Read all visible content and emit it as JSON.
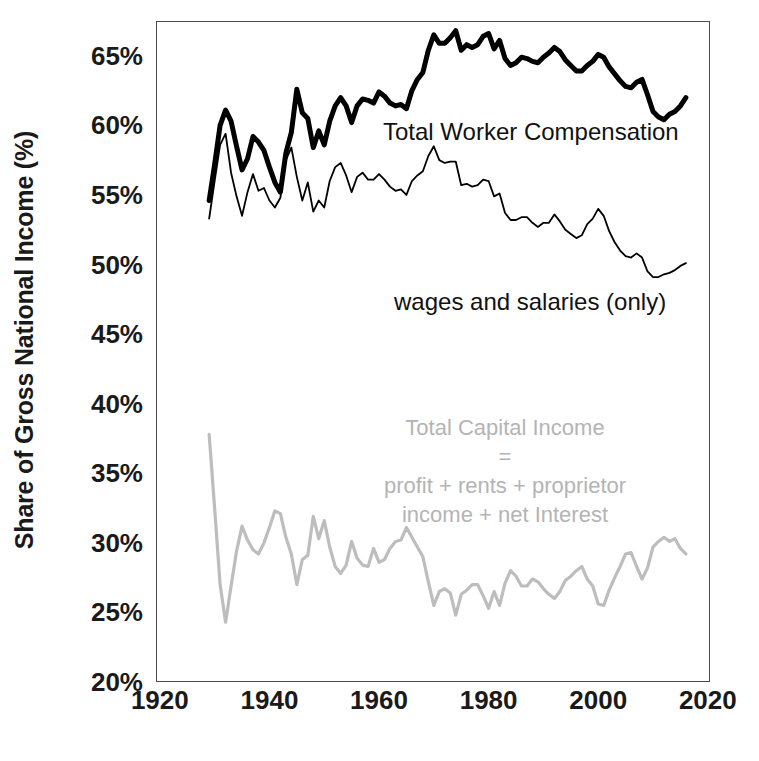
{
  "figure": {
    "background": "#ffffff",
    "plot_border_color": "#4a4a4a"
  },
  "axes": {
    "ylabel": "Share of Gross National Income (%)",
    "yticks": [
      "20%",
      "25%",
      "30%",
      "35%",
      "40%",
      "45%",
      "50%",
      "55%",
      "60%",
      "65%"
    ],
    "ytick_values": [
      20,
      25,
      30,
      35,
      40,
      45,
      50,
      55,
      60,
      65
    ],
    "xticks": [
      "1920",
      "1940",
      "1960",
      "1980",
      "2000",
      "2020"
    ],
    "xtick_values": [
      1920,
      1940,
      1960,
      1980,
      2000,
      2020
    ],
    "xlabel": ""
  },
  "annotations": {
    "total_worker_compensation": "Total Worker Compensation",
    "wages_and_salaries": "wages and salaries (only)",
    "total_capital_income_lines": [
      "Total Capital Income",
      "=",
      "profit + rents + proprietor",
      "income + net Interest"
    ]
  },
  "chart_data": {
    "type": "line",
    "title": "",
    "xlabel": "",
    "ylabel": "Share of Gross National Income (%)",
    "xlim": [
      1919.3,
      2020.4
    ],
    "ylim": [
      20,
      67.5
    ],
    "grid": false,
    "legend": "inline-annotations",
    "series": [
      {
        "name": "Total Worker Compensation",
        "color": "#000000",
        "linewidth": 5,
        "x": [
          1929,
          1930,
          1931,
          1932,
          1933,
          1934,
          1935,
          1936,
          1937,
          1938,
          1939,
          1940,
          1941,
          1942,
          1943,
          1944,
          1945,
          1946,
          1947,
          1948,
          1949,
          1950,
          1951,
          1952,
          1953,
          1954,
          1955,
          1956,
          1957,
          1958,
          1959,
          1960,
          1961,
          1962,
          1963,
          1964,
          1965,
          1966,
          1967,
          1968,
          1969,
          1970,
          1971,
          1972,
          1973,
          1974,
          1975,
          1976,
          1977,
          1978,
          1979,
          1980,
          1981,
          1982,
          1983,
          1984,
          1985,
          1986,
          1987,
          1988,
          1989,
          1990,
          1991,
          1992,
          1993,
          1994,
          1995,
          1996,
          1997,
          1998,
          1999,
          2000,
          2001,
          2002,
          2003,
          2004,
          2005,
          2006,
          2007,
          2008,
          2009,
          2010,
          2011,
          2012,
          2013,
          2014,
          2015,
          2016
        ],
        "values": [
          54.6,
          57.2,
          60.0,
          61.1,
          60.3,
          58.5,
          56.8,
          57.6,
          59.2,
          58.8,
          58.2,
          57.0,
          55.9,
          55.2,
          58.0,
          59.5,
          62.6,
          60.9,
          60.5,
          58.4,
          59.6,
          58.6,
          60.3,
          61.4,
          62.0,
          61.4,
          60.2,
          61.4,
          61.9,
          61.8,
          61.6,
          62.4,
          62.1,
          61.6,
          61.4,
          61.5,
          61.2,
          62.5,
          63.3,
          63.8,
          65.4,
          66.5,
          65.9,
          65.9,
          66.3,
          66.8,
          65.4,
          65.8,
          65.6,
          65.8,
          66.4,
          66.6,
          65.5,
          66.1,
          64.8,
          64.3,
          64.5,
          64.9,
          64.8,
          64.6,
          64.5,
          64.9,
          65.2,
          65.6,
          65.3,
          64.7,
          64.3,
          63.9,
          63.9,
          64.3,
          64.6,
          65.1,
          64.9,
          64.2,
          63.7,
          63.2,
          62.8,
          62.7,
          63.1,
          63.3,
          62.2,
          61.0,
          60.6,
          60.4,
          60.8,
          61.0,
          61.4,
          62.0
        ]
      },
      {
        "name": "wages and salaries (only)",
        "color": "#000000",
        "linewidth": 1.8,
        "x": [
          1929,
          1930,
          1931,
          1932,
          1933,
          1934,
          1935,
          1936,
          1937,
          1938,
          1939,
          1940,
          1941,
          1942,
          1943,
          1944,
          1945,
          1946,
          1947,
          1948,
          1949,
          1950,
          1951,
          1952,
          1953,
          1954,
          1955,
          1956,
          1957,
          1958,
          1959,
          1960,
          1961,
          1962,
          1963,
          1964,
          1965,
          1966,
          1967,
          1968,
          1969,
          1970,
          1971,
          1972,
          1973,
          1974,
          1975,
          1976,
          1977,
          1978,
          1979,
          1980,
          1981,
          1982,
          1983,
          1984,
          1985,
          1986,
          1987,
          1988,
          1989,
          1990,
          1991,
          1992,
          1993,
          1994,
          1995,
          1996,
          1997,
          1998,
          1999,
          2000,
          2001,
          2002,
          2003,
          2004,
          2005,
          2006,
          2007,
          2008,
          2009,
          2010,
          2011,
          2012,
          2013,
          2014,
          2015,
          2016
        ],
        "values": [
          53.3,
          56.0,
          58.6,
          59.4,
          56.6,
          54.9,
          53.5,
          55.2,
          56.5,
          55.3,
          55.5,
          54.6,
          54.1,
          54.8,
          57.5,
          58.4,
          56.3,
          54.6,
          55.9,
          53.8,
          54.6,
          54.1,
          56.0,
          57.0,
          57.3,
          56.4,
          55.2,
          56.3,
          56.6,
          56.1,
          56.1,
          56.5,
          56.1,
          55.6,
          55.3,
          55.4,
          55.0,
          56.0,
          56.4,
          56.7,
          57.8,
          58.5,
          57.5,
          57.3,
          57.4,
          57.4,
          55.7,
          55.8,
          55.6,
          55.7,
          56.1,
          56.0,
          54.9,
          55.1,
          53.7,
          53.2,
          53.2,
          53.4,
          53.4,
          53.0,
          52.7,
          53.0,
          53.0,
          53.6,
          53.1,
          52.5,
          52.2,
          51.9,
          52.1,
          52.9,
          53.3,
          54.0,
          53.5,
          52.4,
          51.6,
          51.0,
          50.6,
          50.5,
          50.8,
          50.5,
          49.5,
          49.1,
          49.1,
          49.3,
          49.4,
          49.6,
          49.9,
          50.1
        ]
      },
      {
        "name": "Total Capital Income",
        "color": "#bdbdbd",
        "linewidth": 3.2,
        "x": [
          1929,
          1930,
          1931,
          1932,
          1933,
          1934,
          1935,
          1936,
          1937,
          1938,
          1939,
          1940,
          1941,
          1942,
          1943,
          1944,
          1945,
          1946,
          1947,
          1948,
          1949,
          1950,
          1951,
          1952,
          1953,
          1954,
          1955,
          1956,
          1957,
          1958,
          1959,
          1960,
          1961,
          1962,
          1963,
          1964,
          1965,
          1966,
          1967,
          1968,
          1969,
          1970,
          1971,
          1972,
          1973,
          1974,
          1975,
          1976,
          1977,
          1978,
          1979,
          1980,
          1981,
          1982,
          1983,
          1984,
          1985,
          1986,
          1987,
          1988,
          1989,
          1990,
          1991,
          1992,
          1993,
          1994,
          1995,
          1996,
          1997,
          1998,
          1999,
          2000,
          2001,
          2002,
          2003,
          2004,
          2005,
          2006,
          2007,
          2008,
          2009,
          2010,
          2011,
          2012,
          2013,
          2014,
          2015,
          2016
        ],
        "values": [
          37.8,
          32.5,
          27.0,
          24.3,
          26.9,
          29.4,
          31.2,
          30.2,
          29.5,
          29.2,
          30.0,
          31.1,
          32.3,
          32.1,
          30.4,
          29.2,
          27.0,
          28.8,
          29.1,
          31.9,
          30.3,
          31.6,
          29.7,
          28.3,
          27.8,
          28.4,
          30.1,
          28.9,
          28.4,
          28.3,
          29.6,
          28.6,
          28.8,
          29.6,
          30.1,
          30.2,
          31.1,
          30.4,
          29.7,
          29.0,
          27.2,
          25.5,
          26.5,
          26.7,
          26.4,
          24.8,
          26.3,
          26.6,
          27.0,
          27.0,
          26.2,
          25.3,
          26.5,
          25.5,
          27.1,
          28.0,
          27.6,
          26.9,
          26.9,
          27.4,
          27.2,
          26.7,
          26.3,
          26.0,
          26.5,
          27.3,
          27.6,
          28.0,
          28.3,
          27.4,
          26.9,
          25.6,
          25.5,
          26.6,
          27.5,
          28.3,
          29.2,
          29.3,
          28.3,
          27.4,
          28.2,
          29.7,
          30.1,
          30.4,
          30.1,
          30.3,
          29.6,
          29.2
        ]
      }
    ]
  }
}
